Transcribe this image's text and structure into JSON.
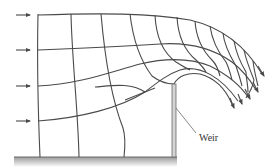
{
  "diagram": {
    "labels": {
      "weir": "Weir"
    },
    "colors": {
      "line": "#4a4a4a",
      "weir_fill": "#d4d4d4",
      "ground_top": "#9a9a9a",
      "ground_bottom": "#ffffff",
      "background": "#ffffff"
    },
    "inflow_arrows_y": [
      15,
      50,
      86,
      121
    ],
    "elements": [
      "streamlines",
      "equipotential-lines",
      "inflow-arrows",
      "outflow-arrows",
      "weir-plate",
      "channel-floor",
      "weir-label"
    ]
  }
}
